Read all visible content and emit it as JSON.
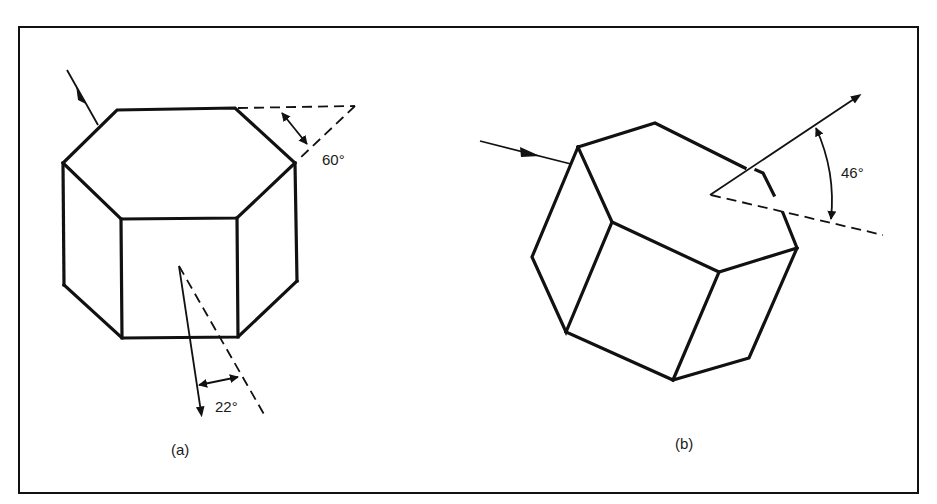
{
  "figure": {
    "type": "diagram",
    "colors": {
      "ink": "#111111",
      "background": "#ffffff"
    },
    "panels": [
      {
        "id": "a",
        "caption": "(a)",
        "shape": "hexagonal prism (vertical axis)",
        "angles": [
          {
            "label": "60°",
            "meaning": "prism apex angle between top face edge extension and side face"
          },
          {
            "label": "22°",
            "meaning": "minimum deviation angle of refracted ray"
          }
        ]
      },
      {
        "id": "b",
        "caption": "(b)",
        "shape": "hexagonal prism (tilted)",
        "angles": [
          {
            "label": "46°",
            "meaning": "deviation angle of ray through 90° prism"
          }
        ]
      }
    ]
  }
}
